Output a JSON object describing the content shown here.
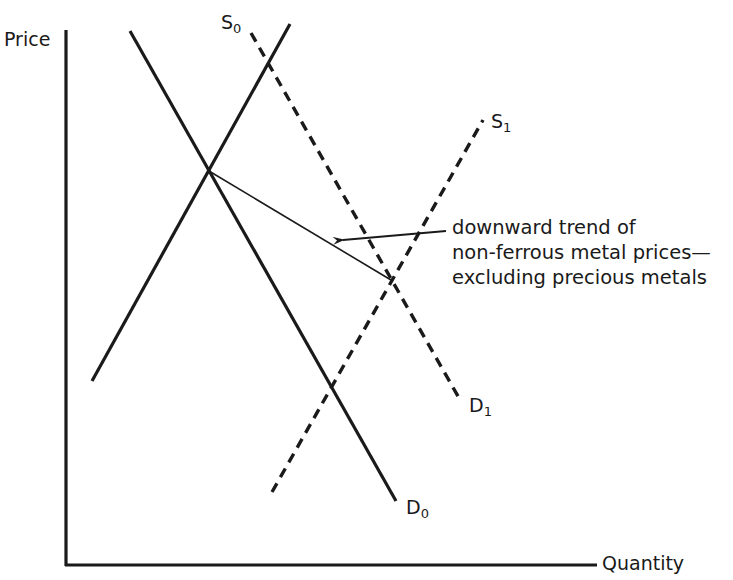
{
  "diagram": {
    "type": "supply-demand",
    "axes": {
      "y_label": "Price",
      "x_label": "Quantity"
    },
    "curves": [
      {
        "id": "S0",
        "label_main": "S",
        "label_sub": "0",
        "kind": "supply",
        "style": "solid",
        "from": [
          92,
          381
        ],
        "to": [
          290,
          24
        ]
      },
      {
        "id": "D0",
        "label_main": "D",
        "label_sub": "0",
        "kind": "demand",
        "style": "solid",
        "from": [
          130,
          31
        ],
        "to": [
          396,
          501
        ]
      },
      {
        "id": "S1",
        "label_main": "S",
        "label_sub": "1",
        "kind": "supply",
        "style": "dashed",
        "from": [
          272,
          492
        ],
        "to": [
          483,
          120
        ]
      },
      {
        "id": "D1",
        "label_main": "D",
        "label_sub": "1",
        "kind": "demand",
        "style": "dashed",
        "from": [
          251,
          33
        ],
        "to": [
          459,
          398
        ]
      }
    ],
    "trend_line": {
      "from": [
        209,
        171
      ],
      "to": [
        391,
        280
      ],
      "description": "connects equilibrium S0/D0 to equilibrium S1/D1"
    },
    "annotation": {
      "lines": [
        "downward trend of",
        "non-ferrous metal prices—",
        "excluding precious metals"
      ],
      "arrow_from": [
        446,
        231
      ],
      "arrow_to": [
        343,
        240
      ]
    },
    "colors": {
      "ink": "#1a1a1a",
      "background": "#ffffff"
    }
  }
}
